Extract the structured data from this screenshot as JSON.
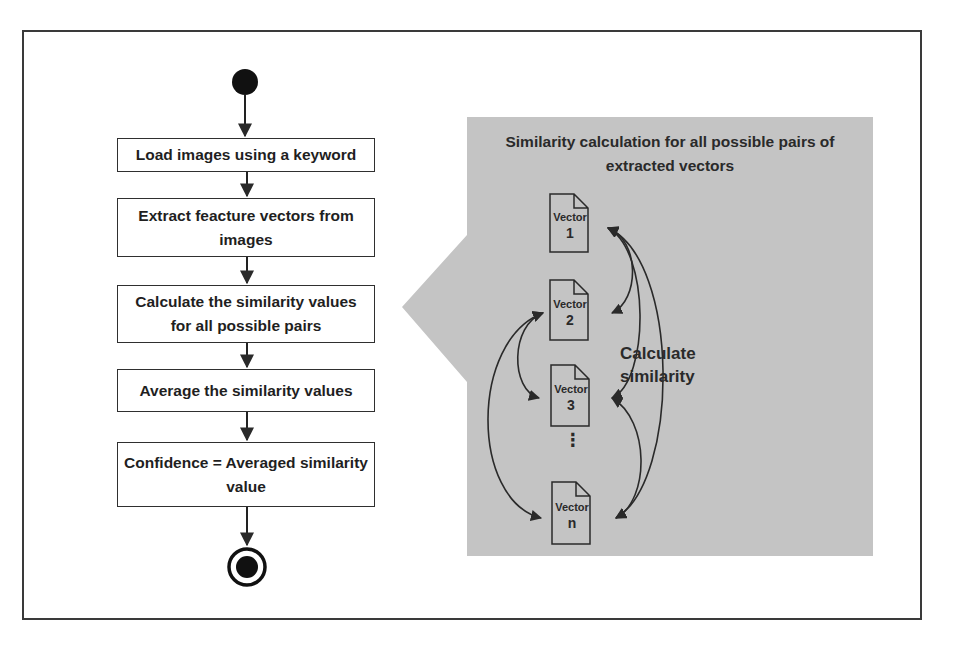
{
  "flowchart": {
    "steps": [
      {
        "label": "Load images using a keyword"
      },
      {
        "label": "Extract feacture vectors from images"
      },
      {
        "label": "Calculate the similarity values for all possible pairs"
      },
      {
        "label": "Average the similarity values"
      },
      {
        "label": "Confidence = Averaged similarity value"
      }
    ],
    "start_node": "start-node",
    "end_node": "end-node"
  },
  "callout": {
    "title": "Similarity calculation for all possible pairs of extracted vectors",
    "relation_label": "Calculate similarity",
    "vectors": [
      {
        "line1": "Vector",
        "line2": "1"
      },
      {
        "line1": "Vector",
        "line2": "2"
      },
      {
        "line1": "Vector",
        "line2": "3"
      },
      {
        "line1": "Vector",
        "line2": "n"
      }
    ],
    "ellipsis": "⋮"
  },
  "colors": {
    "panel_fill": "#c4c4c4",
    "stroke": "#2f2f2f",
    "background": "#ffffff"
  }
}
